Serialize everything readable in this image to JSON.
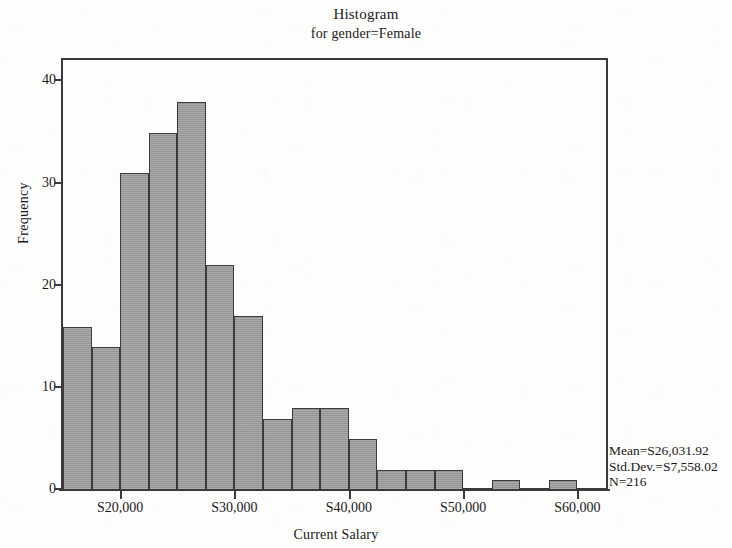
{
  "chart_data": {
    "type": "bar",
    "title": "Histogram",
    "subtitle": "for gender=Female",
    "xlabel": "Current Salary",
    "ylabel": "Frequency",
    "grid": false,
    "legend": "none",
    "xlim": [
      15000,
      62500
    ],
    "ylim": [
      0,
      42
    ],
    "bin_width": 2500,
    "y_ticks": [
      0,
      10,
      20,
      30,
      40
    ],
    "y_tick_labels": [
      "0",
      "10",
      "20",
      "30",
      "40"
    ],
    "x_ticks": [
      20000,
      30000,
      40000,
      50000,
      60000
    ],
    "x_tick_labels": [
      "S20,000",
      "S30,000",
      "S40,000",
      "S50,000",
      "S60,000"
    ],
    "categories": [
      "16,250",
      "18,750",
      "21,250",
      "23,750",
      "26,250",
      "28,750",
      "31,250",
      "33,750",
      "36,250",
      "38,750",
      "41,250",
      "43,750",
      "46,250",
      "48,750",
      "51,250",
      "53,750",
      "56,250",
      "58,750",
      "61,250"
    ],
    "bin_starts": [
      15000,
      17500,
      20000,
      22500,
      25000,
      27500,
      30000,
      32500,
      35000,
      37500,
      40000,
      42500,
      45000,
      47500,
      50000,
      52500,
      55000,
      57500,
      60000
    ],
    "values": [
      16,
      14,
      31,
      35,
      38,
      22,
      17,
      7,
      8,
      8,
      5,
      2,
      2,
      2,
      0,
      1,
      1,
      3,
      1
    ],
    "bars": [
      {
        "x0": 15000,
        "x1": 17500,
        "value": 16
      },
      {
        "x0": 17500,
        "x1": 20000,
        "value": 14
      },
      {
        "x0": 20000,
        "x1": 22500,
        "value": 31
      },
      {
        "x0": 22500,
        "x1": 25000,
        "value": 35
      },
      {
        "x0": 25000,
        "x1": 27500,
        "value": 38
      },
      {
        "x0": 27500,
        "x1": 30000,
        "value": 22
      },
      {
        "x0": 30000,
        "x1": 32500,
        "value": 17
      },
      {
        "x0": 32500,
        "x1": 35000,
        "value": 7
      },
      {
        "x0": 35000,
        "x1": 37500,
        "value": 8
      },
      {
        "x0": 37500,
        "x1": 40000,
        "value": 8
      },
      {
        "x0": 40000,
        "x1": 42500,
        "value": 5
      },
      {
        "x0": 42500,
        "x1": 45000,
        "value": 2
      },
      {
        "x0": 45000,
        "x1": 47500,
        "value": 2
      },
      {
        "x0": 47500,
        "x1": 50000,
        "value": 2
      },
      {
        "x0": 50000,
        "x1": 52500,
        "value": 0
      },
      {
        "x0": 52500,
        "x1": 55000,
        "value": 1
      },
      {
        "x0": 55000,
        "x1": 57500,
        "value": 0
      },
      {
        "x0": 57500,
        "x1": 60000,
        "value": 1
      },
      {
        "x0": 60000,
        "x1": 62500,
        "value": 0
      }
    ],
    "bar_fill_color": "#9c9c9c",
    "bar_edge_color": "#3b3b3b",
    "axis_color": "#3a3a3a",
    "background_color": "#fdfdfc",
    "annotations": {
      "mean": "Mean=S26,031.92",
      "std_dev": "Std.Dev.=S7,558.02",
      "n": "N=216"
    }
  }
}
